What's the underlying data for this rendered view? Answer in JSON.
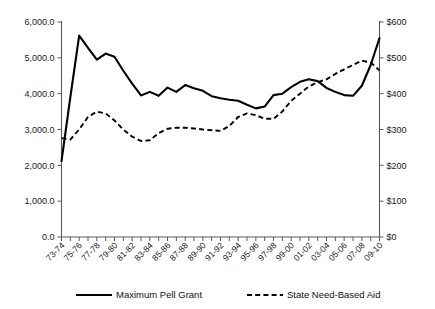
{
  "chart_data": {
    "type": "line",
    "title": "",
    "subtitle": "",
    "xlabel": "",
    "ylabel": "",
    "y2label": "",
    "grid": false,
    "legend_position": "bottom",
    "categories": [
      "73-74",
      "74-75",
      "75-76",
      "76-77",
      "77-78",
      "78-79",
      "79-80",
      "80-81",
      "81-82",
      "82-83",
      "83-84",
      "84-85",
      "85-86",
      "86-87",
      "87-88",
      "88-89",
      "89-90",
      "90-91",
      "91-92",
      "92-93",
      "93-94",
      "94-95",
      "95-96",
      "96-97",
      "97-98",
      "98-99",
      "99-00",
      "00-01",
      "01-02",
      "02-03",
      "03-04",
      "04-05",
      "05-06",
      "06-07",
      "07-08",
      "08-09",
      "09-10"
    ],
    "xtick_labels": [
      "73-74",
      "75-76",
      "77-78",
      "79-80",
      "81-82",
      "83-84",
      "85-86",
      "87-88",
      "89-90",
      "91-92",
      "93-94",
      "95-96",
      "97-98",
      "99-00",
      "01-02",
      "03-04",
      "05-06",
      "07-08",
      "09-10"
    ],
    "ylim": [
      0,
      6000
    ],
    "ytick_labels": [
      "0.0",
      "1,000.0",
      "2,000.0",
      "3,000.0",
      "4,000.0",
      "5,000.0",
      "6,000.0"
    ],
    "ytick_values": [
      0,
      1000,
      2000,
      3000,
      4000,
      5000,
      6000
    ],
    "y2lim": [
      0,
      600
    ],
    "y2tick_labels": [
      "$0",
      "$100",
      "$200",
      "$300",
      "$400",
      "$500",
      "$600"
    ],
    "y2tick_values": [
      0,
      100,
      200,
      300,
      400,
      500,
      600
    ],
    "series": [
      {
        "name": "Maximum Pell Grant",
        "style": "solid",
        "axis": "left",
        "values": [
          2120,
          3900,
          5620,
          5280,
          4950,
          5120,
          5030,
          4640,
          4280,
          3950,
          4050,
          3940,
          4170,
          4050,
          4240,
          4150,
          4080,
          3930,
          3870,
          3830,
          3800,
          3690,
          3590,
          3640,
          3960,
          4000,
          4180,
          4330,
          4400,
          4350,
          4160,
          4050,
          3960,
          3940,
          4220,
          4800,
          5550
        ]
      },
      {
        "name": "State Need-Based Aid",
        "style": "dashed",
        "axis": "right",
        "values": [
          276,
          272,
          300,
          335,
          350,
          345,
          325,
          300,
          280,
          268,
          270,
          290,
          302,
          305,
          305,
          303,
          300,
          298,
          296,
          310,
          335,
          345,
          340,
          330,
          330,
          350,
          380,
          400,
          420,
          432,
          440,
          455,
          468,
          480,
          492,
          487,
          465
        ]
      }
    ],
    "legend": [
      {
        "label": "Maximum Pell Grant",
        "style": "solid"
      },
      {
        "label": "State Need-Based Aid",
        "style": "dashed"
      }
    ]
  }
}
